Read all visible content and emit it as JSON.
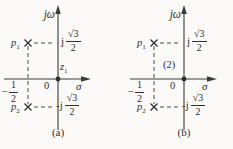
{
  "panels": [
    {
      "caption": "(a)",
      "vertical_axis_label": "jω",
      "horizontal_axis_label": "σ",
      "origin_label": "0",
      "pole1": {
        "name": "p",
        "sub": "1"
      },
      "pole2": {
        "name": "p",
        "sub": "2"
      },
      "zero_annotation": {
        "name": "z",
        "sub": "1"
      },
      "pos_imag_label": {
        "prefix": "j",
        "numerator": "√3",
        "denominator": "2"
      },
      "neg_imag_label": {
        "prefix": "-j",
        "numerator": "√3",
        "denominator": "2"
      },
      "real_axis_label": {
        "sign": "−",
        "numerator": "1",
        "denominator": "2"
      }
    },
    {
      "caption": "(b)",
      "vertical_axis_label": "jω",
      "horizontal_axis_label": "σ",
      "origin_label": "0",
      "pole1": {
        "name": "p",
        "sub": "1"
      },
      "pole2": {
        "name": "p",
        "sub": "2"
      },
      "zero_annotation": {
        "name": "(2)",
        "sub": ""
      },
      "pos_imag_label": {
        "prefix": "j",
        "numerator": "√3",
        "denominator": "2"
      },
      "neg_imag_label": {
        "prefix": "-j",
        "numerator": "√3",
        "denominator": "2"
      },
      "real_axis_label": {
        "sign": "−",
        "numerator": "1",
        "denominator": "2"
      }
    }
  ],
  "colors": {
    "ink": "#2e2e2e",
    "line": "#3a3a3a",
    "background": "#fbfaf8"
  }
}
